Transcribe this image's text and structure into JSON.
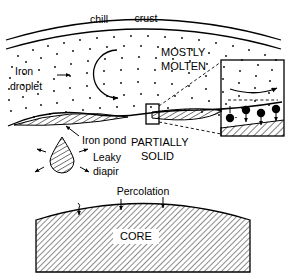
{
  "figure": {
    "background_color": "#ffffff",
    "ink_color": "#000000"
  },
  "upper_panel": {
    "name": "magma-ocean-panel",
    "crust_labels": [
      {
        "id": "chill",
        "text": "chill"
      },
      {
        "id": "crust",
        "text": "crust"
      }
    ],
    "region_labels": [
      {
        "id": "mostly",
        "text": "MOSTLY"
      },
      {
        "id": "molten",
        "text": "MOLTEN"
      }
    ],
    "iron_droplet_label": {
      "line1": "Iron",
      "line2": "droplet"
    },
    "iron_pond_label": "Iron pond",
    "leaky_diapir_label": {
      "line1": "Leaky",
      "line2": "diapir"
    },
    "partially_solid_label": {
      "line1": "PARTIALLY",
      "line2": "SOLID"
    },
    "convection_arrow": "counterclockwise-circulation-arrow",
    "droplet_settling_arrow": "rightward-droplet-arrow"
  },
  "inset_panel": {
    "name": "partially-solid-detail-inset",
    "flow_arrow": "rightward-flow-arrow",
    "dash_layer": "dashed-interface-line",
    "droplet_count": 4,
    "droplets_label": "settling-iron-droplets",
    "bottom_wedge": "hatched-solid-wedge"
  },
  "lower_panel": {
    "name": "core-panel",
    "percolation_label": "Percolation",
    "core_label": "CORE",
    "percolation_arrow_count": 3
  }
}
